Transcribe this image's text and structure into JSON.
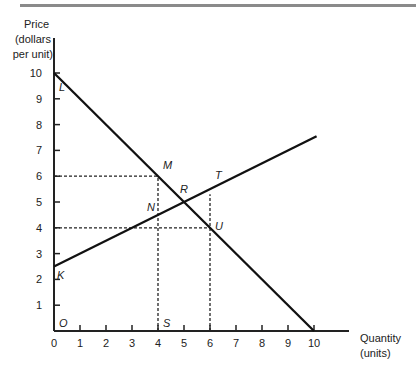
{
  "chart_data": {
    "type": "line",
    "title": "",
    "xlabel": "Quantity (units)",
    "ylabel": "Price (dollars per unit)",
    "xlabel_lines": [
      "Quantity",
      "(units)"
    ],
    "ylabel_lines": [
      "Price",
      "(dollars",
      "per unit)"
    ],
    "xlim": [
      0,
      10
    ],
    "ylim": [
      0,
      10
    ],
    "x_ticks": [
      "0",
      "1",
      "2",
      "3",
      "4",
      "5",
      "6",
      "7",
      "8",
      "9",
      "10"
    ],
    "y_ticks": [
      "1",
      "2",
      "3",
      "4",
      "5",
      "6",
      "7",
      "8",
      "9",
      "10"
    ],
    "grid": false,
    "legend": null,
    "series": [
      {
        "name": "Demand (L to 10)",
        "points": [
          [
            0,
            10
          ],
          [
            10,
            0
          ]
        ],
        "style": "solid"
      },
      {
        "name": "Supply (from K)",
        "points": [
          [
            0,
            2.5
          ],
          [
            10.1,
            7.55
          ]
        ],
        "style": "solid"
      }
    ],
    "reference_lines": [
      {
        "type": "horizontal",
        "y": 6,
        "from_x": 0,
        "to_x": 4,
        "style": "dashed"
      },
      {
        "type": "horizontal",
        "y": 4,
        "from_x": 0,
        "to_x": 6,
        "style": "dashed"
      },
      {
        "type": "vertical",
        "x": 4,
        "from_y": 0,
        "to_y": 6,
        "style": "dashed"
      },
      {
        "type": "vertical",
        "x": 6,
        "from_y": 0,
        "to_y": 5.3,
        "style": "dashed"
      }
    ],
    "annotations": [
      {
        "label": "L",
        "x": 0,
        "y": 10
      },
      {
        "label": "M",
        "x": 4,
        "y": 6
      },
      {
        "label": "R",
        "x": 5,
        "y": 5
      },
      {
        "label": "T",
        "x": 6,
        "y": 5.5
      },
      {
        "label": "N",
        "x": 4,
        "y": 4.5
      },
      {
        "label": "U",
        "x": 6,
        "y": 4
      },
      {
        "label": "K",
        "x": 0,
        "y": 2.5
      },
      {
        "label": "O",
        "x": 0,
        "y": 0
      },
      {
        "label": "S",
        "x": 4,
        "y": 0
      }
    ]
  }
}
